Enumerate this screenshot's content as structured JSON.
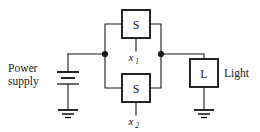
{
  "diagram": {
    "stroke_color": "#1a1a1a",
    "background_color": "#ffffff",
    "labels": {
      "power_supply_line1": "Power",
      "power_supply_line2": "supply",
      "light": "Light"
    },
    "components": [
      {
        "id": "switch-top",
        "box_label": "S",
        "variable": "x",
        "subscript": "1"
      },
      {
        "id": "switch-bottom",
        "box_label": "S",
        "variable": "x",
        "subscript": "2"
      },
      {
        "id": "lamp",
        "box_label": "L",
        "side_label": "Light"
      },
      {
        "id": "battery",
        "side_label_line1": "Power",
        "side_label_line2": "supply"
      }
    ],
    "nodes": [
      {
        "id": "node-left",
        "cx": 105,
        "cy": 54
      },
      {
        "id": "node-right",
        "cx": 161,
        "cy": 54
      }
    ]
  }
}
